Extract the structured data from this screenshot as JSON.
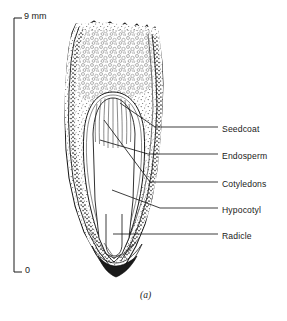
{
  "figure": {
    "caption": "(a)",
    "background_color": "#ffffff",
    "ink_color": "#1a1a1a"
  },
  "scale_bar": {
    "top_label": "9  mm",
    "bottom_label": "0",
    "unit": "mm",
    "max_value": "9",
    "min_value": "0",
    "orientation": "vertical"
  },
  "labels": [
    {
      "text": "Seedcoat",
      "y": 130
    },
    {
      "text": "Endosperm",
      "y": 157
    },
    {
      "text": "Cotyledons",
      "y": 185
    },
    {
      "text": "Hypocotyl",
      "y": 211
    },
    {
      "text": "Radicle",
      "y": 237
    }
  ]
}
